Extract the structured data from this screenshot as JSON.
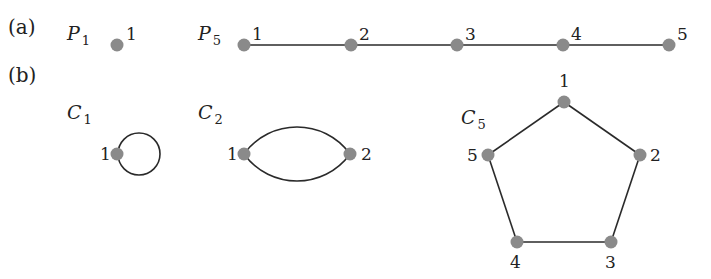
{
  "panels": {
    "a": {
      "label": "(a)",
      "x": 8,
      "y": 34
    },
    "b": {
      "label": "(b)",
      "x": 8,
      "y": 82
    }
  },
  "colors": {
    "node": "#8a8a8a",
    "edge": "#2a2a2a",
    "text": "#222222"
  },
  "node_radius": 6.5,
  "graphs": [
    {
      "id": "P1",
      "name": "P",
      "subscript": "1",
      "name_pos": [
        67,
        40
      ],
      "nodes": [
        {
          "id": "1",
          "x": 117,
          "y": 45,
          "lx": 126,
          "ly": 40
        }
      ],
      "edges": []
    },
    {
      "id": "P5",
      "name": "P",
      "subscript": "5",
      "name_pos": [
        198,
        40
      ],
      "nodes": [
        {
          "id": "1",
          "x": 244,
          "y": 45,
          "lx": 252,
          "ly": 40
        },
        {
          "id": "2",
          "x": 351,
          "y": 45,
          "lx": 359,
          "ly": 40
        },
        {
          "id": "3",
          "x": 457,
          "y": 45,
          "lx": 465,
          "ly": 40
        },
        {
          "id": "4",
          "x": 563,
          "y": 45,
          "lx": 571,
          "ly": 40
        },
        {
          "id": "5",
          "x": 669,
          "y": 45,
          "lx": 677,
          "ly": 40
        }
      ],
      "edges": [
        [
          "1",
          "2"
        ],
        [
          "2",
          "3"
        ],
        [
          "3",
          "4"
        ],
        [
          "4",
          "5"
        ]
      ]
    },
    {
      "id": "C1",
      "name": "C",
      "subscript": "1",
      "name_pos": [
        67,
        119
      ],
      "nodes": [
        {
          "id": "1",
          "x": 117,
          "y": 154,
          "lx": 100,
          "ly": 160
        }
      ],
      "edges": [],
      "loops": [
        {
          "cx": 139,
          "cy": 154,
          "r": 21
        }
      ]
    },
    {
      "id": "C2",
      "name": "C",
      "subscript": "2",
      "name_pos": [
        198,
        119
      ],
      "nodes": [
        {
          "id": "1",
          "x": 244,
          "y": 154,
          "lx": 227,
          "ly": 160
        },
        {
          "id": "2",
          "x": 350,
          "y": 154,
          "lx": 361,
          "ly": 160
        }
      ],
      "edges": [],
      "arcs": [
        {
          "d": "M244,154 C270,118 324,118 350,154"
        },
        {
          "d": "M244,154 C270,190 324,190 350,154"
        }
      ]
    },
    {
      "id": "C5",
      "name": "C",
      "subscript": "5",
      "name_pos": [
        461,
        124
      ],
      "nodes": [
        {
          "id": "1",
          "x": 564,
          "y": 102,
          "lx": 559,
          "ly": 87
        },
        {
          "id": "2",
          "x": 640,
          "y": 155,
          "lx": 650,
          "ly": 161
        },
        {
          "id": "3",
          "x": 611,
          "y": 242,
          "lx": 605,
          "ly": 268
        },
        {
          "id": "4",
          "x": 517,
          "y": 242,
          "lx": 510,
          "ly": 268
        },
        {
          "id": "5",
          "x": 488,
          "y": 155,
          "lx": 467,
          "ly": 161
        }
      ],
      "edges": [
        [
          "1",
          "2"
        ],
        [
          "2",
          "3"
        ],
        [
          "3",
          "4"
        ],
        [
          "4",
          "5"
        ],
        [
          "5",
          "1"
        ]
      ]
    }
  ]
}
